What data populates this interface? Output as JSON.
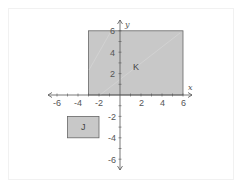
{
  "graph": {
    "x_axis": {
      "name": "x",
      "min": -6,
      "max": 6,
      "tick_step": 1,
      "labels": [
        "-6",
        "-4",
        "-2",
        "2",
        "4",
        "6"
      ]
    },
    "y_axis": {
      "name": "y",
      "min": -6,
      "max": 6,
      "tick_step": 1,
      "labels": [
        "6",
        "4",
        "2",
        "-2",
        "-4",
        "-6"
      ]
    },
    "shapes": [
      {
        "label": "K",
        "x1": -3,
        "y1": 0,
        "x2": 6,
        "y2": 6,
        "fill": "#c8c8c8"
      },
      {
        "label": "J",
        "x1": -5,
        "y1": -2,
        "x2": -2,
        "y2": -4,
        "fill": "#c8c8c8"
      }
    ]
  },
  "colors": {
    "axis": "#555555",
    "shape_fill": "#c8c8c8",
    "shape_stroke": "#666666"
  }
}
